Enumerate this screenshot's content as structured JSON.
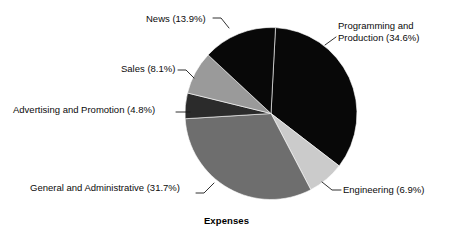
{
  "chart_data": {
    "type": "pie",
    "title": "Expenses",
    "xlabel": "",
    "ylabel": "",
    "legend_position": "none",
    "labels_outside": true,
    "units": "percent",
    "categories": [
      "Programming and Production",
      "Engineering",
      "General and Administrative",
      "Advertising and Promotion",
      "Sales",
      "News"
    ],
    "values": [
      34.6,
      6.9,
      31.7,
      4.8,
      8.1,
      13.9
    ],
    "slice_colors": [
      "#080808",
      "#cbcbcb",
      "#6e6e6e",
      "#2b2b2b",
      "#9a9a9a",
      "#080808"
    ],
    "slice_labels": [
      "Programming and Production (34.6%)",
      "Engineering (6.9%)",
      "General and Administrative (31.7%)",
      "Advertising and Promotion (4.8%)",
      "Sales (8.1%)",
      "News (13.9%)"
    ],
    "start_angle_deg": 3,
    "direction": "clockwise",
    "total": 100.0
  },
  "labels": {
    "programming_line1": "Programming and",
    "programming_line2": "Production (34.6%)",
    "engineering": "Engineering (6.9%)",
    "general_administrative": "General and Administrative (31.7%)",
    "advertising_promotion": "Advertising and Promotion (4.8%)",
    "sales": "Sales (8.1%)",
    "news": "News (13.9%)"
  },
  "title": {
    "text": "Expenses"
  },
  "colors": {
    "background": "#ffffff",
    "text": "#0b0b0b",
    "leader_line": "#1a1a1a",
    "black_slice": "#080808",
    "very_dark_slice": "#2b2b2b",
    "mid_gray_slice": "#9a9a9a",
    "dark_gray_slice": "#6e6e6e",
    "light_gray_slice": "#cbcbcb"
  }
}
